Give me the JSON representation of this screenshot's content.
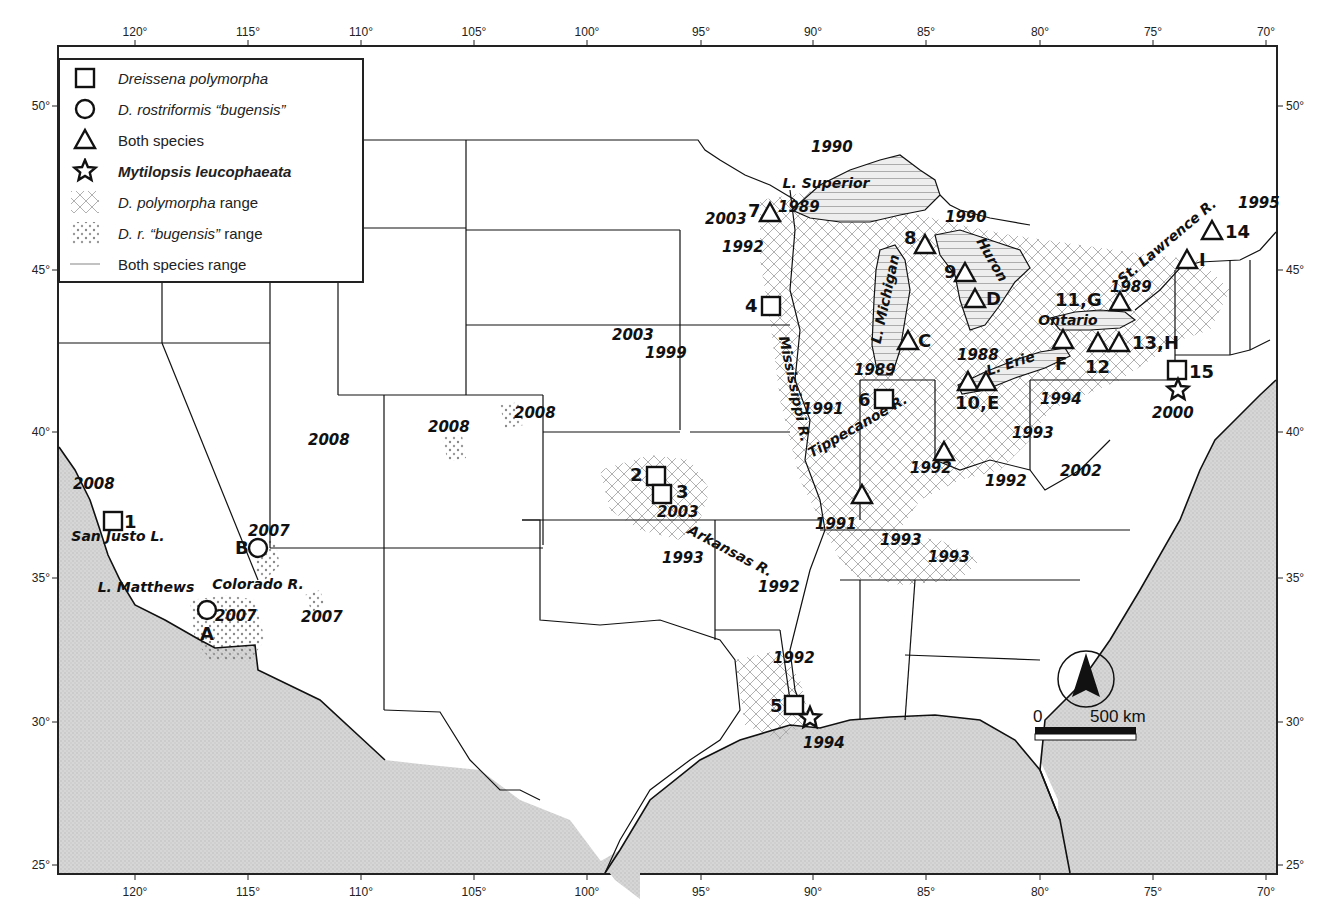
{
  "map": {
    "title": "Distribution of dreissenid mussels and Mytilopsis leucophaeata in the United States",
    "colors": {
      "ocean": "#d9d9d9",
      "land": "#ffffff",
      "border": "#111111",
      "hatch": "#9a9a9a",
      "frame": "#222222"
    }
  },
  "axes": {
    "top": [
      "120°",
      "115°",
      "110°",
      "105°",
      "100°",
      "95°",
      "90°",
      "85°",
      "80°",
      "75°",
      "70°"
    ],
    "bottom": [
      "120°",
      "115°",
      "110°",
      "105°",
      "100°",
      "95°",
      "90°",
      "85°",
      "80°",
      "75°",
      "70°"
    ],
    "left": [
      "50°",
      "45°",
      "40°",
      "35°",
      "30°",
      "25°"
    ],
    "right": [
      "50°",
      "45°",
      "40°",
      "35°",
      "30°",
      "25°"
    ]
  },
  "legend": {
    "items": [
      {
        "symbol": "square",
        "italic": "Dreissena polymorpha",
        "plain": ""
      },
      {
        "symbol": "circle",
        "italic": "D. rostriformis “bugensis”",
        "plain": ""
      },
      {
        "symbol": "triangle",
        "italic": "",
        "plain": "Both species"
      },
      {
        "symbol": "star",
        "italic": "Mytilopsis leucophaeata",
        "plain": ""
      },
      {
        "symbol": "crosshatch",
        "italic": "D. polymorpha",
        "plain": " range"
      },
      {
        "symbol": "dots",
        "italic": "D. r. “bugensis”",
        "plain": " range"
      },
      {
        "symbol": "lines",
        "italic": "",
        "plain": "Both species range"
      }
    ]
  },
  "places": [
    {
      "text": "L. Superior",
      "x": 826,
      "y": 188,
      "rot": 0
    },
    {
      "text": "L. Michigan",
      "x": 890,
      "y": 300,
      "rot": -78
    },
    {
      "text": "Huron",
      "x": 988,
      "y": 262,
      "rot": 60
    },
    {
      "text": "L. Erie",
      "x": 1012,
      "y": 368,
      "rot": -18
    },
    {
      "text": "Ontario",
      "x": 1068,
      "y": 325,
      "rot": 0
    },
    {
      "text": "St. Lawrence R.",
      "x": 1170,
      "y": 245,
      "rot": -40
    },
    {
      "text": "Mississippi R.",
      "x": 790,
      "y": 390,
      "rot": 78
    },
    {
      "text": "Tippecanoe R.",
      "x": 860,
      "y": 430,
      "rot": -30
    },
    {
      "text": "Arkansas R.",
      "x": 728,
      "y": 555,
      "rot": 28
    },
    {
      "text": "San Justo L.",
      "x": 118,
      "y": 541,
      "rot": 0
    },
    {
      "text": "L. Matthews",
      "x": 146,
      "y": 592,
      "rot": 0
    },
    {
      "text": "Colorado R.",
      "x": 258,
      "y": 589,
      "rot": 0
    }
  ],
  "years": [
    {
      "text": "1990",
      "x": 811,
      "y": 152
    },
    {
      "text": "1989",
      "x": 778,
      "y": 212
    },
    {
      "text": "2003",
      "x": 705,
      "y": 224
    },
    {
      "text": "1992",
      "x": 722,
      "y": 252
    },
    {
      "text": "1990",
      "x": 945,
      "y": 222
    },
    {
      "text": "1995",
      "x": 1238,
      "y": 208
    },
    {
      "text": "1989",
      "x": 1110,
      "y": 292
    },
    {
      "text": "2003",
      "x": 612,
      "y": 340
    },
    {
      "text": "1999",
      "x": 645,
      "y": 358
    },
    {
      "text": "1988",
      "x": 957,
      "y": 360
    },
    {
      "text": "1989",
      "x": 854,
      "y": 375
    },
    {
      "text": "1991",
      "x": 802,
      "y": 414
    },
    {
      "text": "1994",
      "x": 1040,
      "y": 404
    },
    {
      "text": "2000",
      "x": 1152,
      "y": 418
    },
    {
      "text": "1993",
      "x": 1012,
      "y": 438
    },
    {
      "text": "2008",
      "x": 514,
      "y": 418
    },
    {
      "text": "2008",
      "x": 428,
      "y": 432
    },
    {
      "text": "2008",
      "x": 308,
      "y": 445
    },
    {
      "text": "1992",
      "x": 910,
      "y": 473
    },
    {
      "text": "1992",
      "x": 985,
      "y": 486
    },
    {
      "text": "2002",
      "x": 1060,
      "y": 476
    },
    {
      "text": "2003",
      "x": 657,
      "y": 517
    },
    {
      "text": "1993",
      "x": 662,
      "y": 563
    },
    {
      "text": "1991",
      "x": 815,
      "y": 529
    },
    {
      "text": "1993",
      "x": 880,
      "y": 545
    },
    {
      "text": "1993",
      "x": 928,
      "y": 562
    },
    {
      "text": "1992",
      "x": 758,
      "y": 592
    },
    {
      "text": "2008",
      "x": 73,
      "y": 489
    },
    {
      "text": "2007",
      "x": 248,
      "y": 536
    },
    {
      "text": "2007",
      "x": 215,
      "y": 621
    },
    {
      "text": "2007",
      "x": 301,
      "y": 622
    },
    {
      "text": "1992",
      "x": 773,
      "y": 663
    },
    {
      "text": "1994",
      "x": 803,
      "y": 748
    }
  ],
  "sites": [
    {
      "symbol": "square",
      "label": "1",
      "x": 113,
      "y": 521,
      "lx": 124,
      "ly": 528
    },
    {
      "symbol": "square",
      "label": "2",
      "x": 656,
      "y": 476,
      "lx": 630,
      "ly": 481
    },
    {
      "symbol": "square",
      "label": "3",
      "x": 662,
      "y": 494,
      "lx": 676,
      "ly": 498
    },
    {
      "symbol": "square",
      "label": "4",
      "x": 771,
      "y": 306,
      "lx": 745,
      "ly": 312
    },
    {
      "symbol": "square",
      "label": "5",
      "x": 794,
      "y": 705,
      "lx": 770,
      "ly": 712
    },
    {
      "symbol": "square",
      "label": "6",
      "x": 884,
      "y": 399,
      "lx": 858,
      "ly": 406
    },
    {
      "symbol": "square",
      "label": "15",
      "x": 1177,
      "y": 370,
      "lx": 1189,
      "ly": 378
    },
    {
      "symbol": "circle",
      "label": "B",
      "x": 258,
      "y": 548,
      "lx": 235,
      "ly": 554
    },
    {
      "symbol": "circle",
      "label": "A",
      "x": 207,
      "y": 610,
      "lx": 200,
      "ly": 640
    },
    {
      "symbol": "triangle",
      "label": "7",
      "x": 770,
      "y": 213,
      "lx": 748,
      "ly": 217
    },
    {
      "symbol": "triangle",
      "label": "8",
      "x": 925,
      "y": 245,
      "lx": 904,
      "ly": 244
    },
    {
      "symbol": "triangle",
      "label": "9",
      "x": 965,
      "y": 273,
      "lx": 944,
      "ly": 278
    },
    {
      "symbol": "triangle",
      "label": "D",
      "x": 975,
      "y": 299,
      "lx": 986,
      "ly": 305
    },
    {
      "symbol": "triangle",
      "label": "C",
      "x": 908,
      "y": 341,
      "lx": 918,
      "ly": 347
    },
    {
      "symbol": "triangle",
      "label": "",
      "x": 968,
      "y": 382,
      "lx": 0,
      "ly": 0
    },
    {
      "symbol": "triangle",
      "label": "10,E",
      "x": 986,
      "y": 382,
      "lx": 955,
      "ly": 409
    },
    {
      "symbol": "triangle",
      "label": "F",
      "x": 1063,
      "y": 340,
      "lx": 1055,
      "ly": 370
    },
    {
      "symbol": "triangle",
      "label": "11,G",
      "x": 1120,
      "y": 302,
      "lx": 1055,
      "ly": 306
    },
    {
      "symbol": "triangle",
      "label": "12",
      "x": 1098,
      "y": 343,
      "lx": 1085,
      "ly": 373
    },
    {
      "symbol": "triangle",
      "label": "13,H",
      "x": 1119,
      "y": 343,
      "lx": 1132,
      "ly": 349
    },
    {
      "symbol": "triangle",
      "label": "I",
      "x": 1187,
      "y": 260,
      "lx": 1199,
      "ly": 266
    },
    {
      "symbol": "triangle",
      "label": "14",
      "x": 1212,
      "y": 231,
      "lx": 1225,
      "ly": 238
    },
    {
      "symbol": "triangle",
      "label": "",
      "x": 944,
      "y": 452,
      "lx": 0,
      "ly": 0
    },
    {
      "symbol": "triangle",
      "label": "",
      "x": 862,
      "y": 495,
      "lx": 0,
      "ly": 0
    },
    {
      "symbol": "star",
      "label": "",
      "x": 1178,
      "y": 390,
      "lx": 0,
      "ly": 0
    },
    {
      "symbol": "star",
      "label": "",
      "x": 810,
      "y": 718,
      "lx": 0,
      "ly": 0
    }
  ],
  "scale_bar": {
    "start_label": "0",
    "end_label": "500 km",
    "north_arrow": "north-arrow"
  }
}
